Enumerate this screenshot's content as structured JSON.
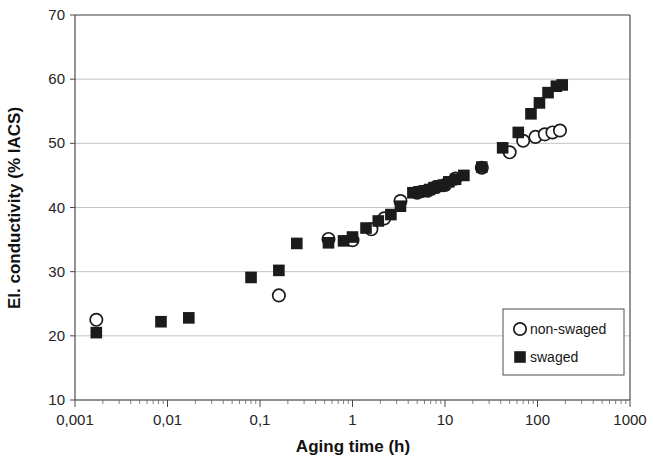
{
  "chart_data": {
    "type": "scatter",
    "title": "",
    "xlabel": "Aging time (h)",
    "ylabel": "El. conductivity (% IACS)",
    "xscale": "log",
    "yscale": "linear",
    "xlim": [
      0.001,
      1000
    ],
    "ylim": [
      10,
      70
    ],
    "ytick_step": 10,
    "xticks": [
      "0,001",
      "0,01",
      "0,1",
      "1",
      "10",
      "100",
      "1000"
    ],
    "xtick_values": [
      0.001,
      0.01,
      0.1,
      1,
      10,
      100,
      1000
    ],
    "yticks": [
      "10",
      "20",
      "30",
      "40",
      "50",
      "60",
      "70"
    ],
    "ytick_values": [
      10,
      20,
      30,
      40,
      50,
      60,
      70
    ],
    "grid": "horizontal",
    "legend_position": "bottom-right",
    "decimal_separator": ",",
    "series": [
      {
        "name": "non-swaged",
        "marker": "open-circle",
        "color": "#1b1b1b",
        "fill": "#ffffff",
        "points": [
          [
            0.0017,
            22.5
          ],
          [
            0.16,
            26.3
          ],
          [
            0.55,
            35.1
          ],
          [
            1.0,
            34.9
          ],
          [
            1.6,
            36.6
          ],
          [
            2.2,
            38.3
          ],
          [
            3.3,
            41.0
          ],
          [
            5.0,
            42.3
          ],
          [
            6.5,
            42.6
          ],
          [
            8.0,
            43.2
          ],
          [
            10.0,
            43.5
          ],
          [
            13.0,
            44.5
          ],
          [
            25.0,
            46.2
          ],
          [
            50.0,
            48.6
          ],
          [
            70.0,
            50.4
          ],
          [
            95.0,
            51.0
          ],
          [
            120.0,
            51.4
          ],
          [
            145.0,
            51.7
          ],
          [
            175.0,
            52.0
          ]
        ]
      },
      {
        "name": "swaged",
        "marker": "filled-square",
        "color": "#1b1b1b",
        "fill": "#1b1b1b",
        "points": [
          [
            0.0017,
            20.5
          ],
          [
            0.0085,
            22.2
          ],
          [
            0.017,
            22.8
          ],
          [
            0.08,
            29.1
          ],
          [
            0.16,
            30.2
          ],
          [
            0.25,
            34.4
          ],
          [
            0.55,
            34.5
          ],
          [
            0.8,
            34.8
          ],
          [
            1.0,
            35.4
          ],
          [
            1.4,
            36.8
          ],
          [
            1.9,
            37.9
          ],
          [
            2.6,
            38.9
          ],
          [
            3.3,
            40.2
          ],
          [
            4.5,
            42.3
          ],
          [
            5.2,
            42.4
          ],
          [
            6.0,
            42.6
          ],
          [
            6.8,
            42.8
          ],
          [
            7.6,
            43.1
          ],
          [
            8.6,
            43.3
          ],
          [
            9.6,
            43.5
          ],
          [
            11.0,
            44.0
          ],
          [
            13.0,
            44.4
          ],
          [
            16.0,
            45.0
          ],
          [
            25.0,
            46.3
          ],
          [
            42.0,
            49.3
          ],
          [
            62.0,
            51.7
          ],
          [
            85.0,
            54.6
          ],
          [
            105.0,
            56.3
          ],
          [
            130.0,
            57.9
          ],
          [
            160.0,
            58.9
          ],
          [
            185.0,
            59.1
          ]
        ]
      }
    ],
    "legend": [
      {
        "label": "non-swaged",
        "marker": "open-circle"
      },
      {
        "label": "swaged",
        "marker": "filled-square"
      }
    ]
  }
}
